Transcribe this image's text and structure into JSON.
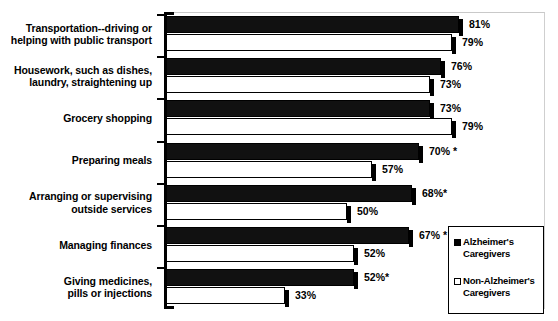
{
  "chart_data": {
    "type": "bar",
    "orientation": "horizontal",
    "title": "",
    "subtitle": "",
    "xlabel": "",
    "ylabel": "",
    "xlim": [
      0,
      100
    ],
    "grid": false,
    "legend_position": "bottom-right",
    "significance_marker": "*",
    "categories": [
      "Transportation--driving or helping with public transport",
      "Housework, such as dishes, laundry, straightening up",
      "Grocery shopping",
      "Preparing meals",
      "Arranging or supervising outside services",
      "Managing finances",
      "Giving medicines, pills or injections"
    ],
    "series": [
      {
        "name": "Alzheimer's Caregivers",
        "values": [
          81,
          76,
          73,
          70,
          68,
          67,
          52
        ],
        "labels": [
          "81%",
          "76%",
          "73%",
          "70% *",
          "68%*",
          "67% *",
          "52%*"
        ]
      },
      {
        "name": "Non-Alzheimer's Caregivers",
        "values": [
          79,
          73,
          79,
          57,
          50,
          52,
          33
        ],
        "labels": [
          "79%",
          "73%",
          "79%",
          "57%",
          "50%",
          "52%",
          "33%"
        ]
      }
    ]
  },
  "categories_lines": [
    [
      "Transportation--driving or",
      "helping with public transport"
    ],
    [
      "Housework, such as dishes,",
      "laundry, straightening up"
    ],
    [
      "Grocery shopping"
    ],
    [
      "Preparing meals"
    ],
    [
      "Arranging or supervising",
      "outside services"
    ],
    [
      "Managing finances"
    ],
    [
      "Giving medicines,",
      "pills or injections"
    ]
  ],
  "legend": {
    "items": [
      {
        "marker": "filled-square-icon",
        "line1": "Alzheimer's",
        "line2": "Caregivers"
      },
      {
        "marker": "hollow-square-icon",
        "line1": "Non-Alzheimer's",
        "line2": "Caregivers"
      }
    ]
  },
  "colors": {
    "series_alzheimers": "#000000",
    "series_non_alzheimers": "#ffffff",
    "axis": "#000000",
    "background": "#ffffff"
  }
}
